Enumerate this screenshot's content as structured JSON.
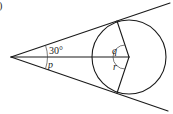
{
  "figure": {
    "corner_mark": ")",
    "angle_labels": {
      "apex_upper": "30°",
      "apex_lower": "p",
      "center_upper": "q",
      "center_lower": "r"
    }
  },
  "colors": {
    "stroke": "#1a1a1a",
    "background": "#ffffff"
  }
}
